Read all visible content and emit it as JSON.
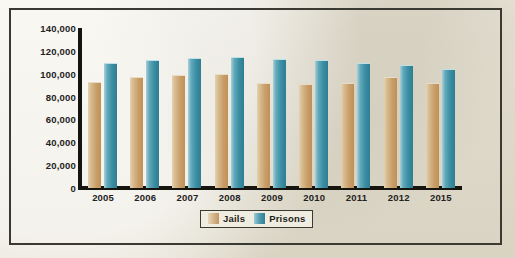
{
  "chart_data": {
    "type": "bar",
    "title": "",
    "xlabel": "",
    "ylabel": "",
    "ylim": [
      0,
      140000
    ],
    "grid": false,
    "legend_position": "bottom-center",
    "categories": [
      "2005",
      "2006",
      "2007",
      "2008",
      "2009",
      "2010",
      "2011",
      "2012",
      "2015"
    ],
    "ytick_labels": [
      "140,000",
      "120,000",
      "100,000",
      "80,000",
      "60,000",
      "40,000",
      "20,000",
      "0"
    ],
    "yticks": [
      140000,
      120000,
      100000,
      80000,
      60000,
      40000,
      20000,
      0
    ],
    "series": [
      {
        "name": "Jails",
        "color": "#c99f69",
        "values": [
          93000,
          97000,
          99000,
          100000,
          92000,
          91000,
          92000,
          97000,
          92000
        ]
      },
      {
        "name": "Prisons",
        "color": "#3b8ea3",
        "values": [
          109000,
          112000,
          114000,
          115000,
          113000,
          112000,
          109000,
          108000,
          104000
        ]
      }
    ]
  },
  "legend": {
    "items": [
      {
        "label": "Jails",
        "swatch": "jails-swatch"
      },
      {
        "label": "Prisons",
        "swatch": "prisons-swatch"
      }
    ]
  },
  "colors": {
    "background": "#eceade",
    "frame_border": "#3a3a33",
    "axis": "#15140f",
    "jails": "#c99f69",
    "prisons": "#3b8ea3",
    "text": "#23221e"
  }
}
